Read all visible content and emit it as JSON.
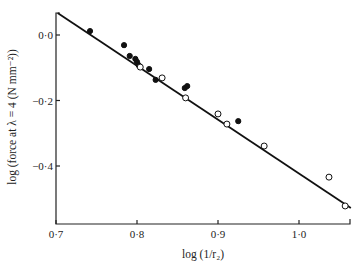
{
  "chart_data": {
    "type": "scatter",
    "title": "",
    "xlabel": "log (1/r₂)",
    "ylabel": "log (force at λ = 4 (N mm⁻²))",
    "xlim": [
      0.7,
      1.06
    ],
    "ylim": [
      -0.58,
      0.07
    ],
    "grid": false,
    "legend": null,
    "x_ticks": [
      {
        "value": 0.7,
        "label": "0·7"
      },
      {
        "value": 0.8,
        "label": "0·8"
      },
      {
        "value": 0.9,
        "label": "0·9"
      },
      {
        "value": 1.0,
        "label": "1·0"
      }
    ],
    "y_ticks": [
      {
        "value": 0.0,
        "label": "0·0"
      },
      {
        "value": -0.2,
        "label": "−0·2"
      },
      {
        "value": -0.4,
        "label": "−0·4"
      }
    ],
    "series": [
      {
        "name": "filled circles",
        "marker": "filled-circle",
        "points": [
          {
            "x": 0.742,
            "y": 0.012
          },
          {
            "x": 0.784,
            "y": -0.031
          },
          {
            "x": 0.791,
            "y": -0.064
          },
          {
            "x": 0.798,
            "y": -0.073
          },
          {
            "x": 0.8,
            "y": -0.082
          },
          {
            "x": 0.802,
            "y": -0.092
          },
          {
            "x": 0.815,
            "y": -0.104
          },
          {
            "x": 0.823,
            "y": -0.137
          },
          {
            "x": 0.859,
            "y": -0.162
          },
          {
            "x": 0.862,
            "y": -0.156
          },
          {
            "x": 0.925,
            "y": -0.263
          }
        ]
      },
      {
        "name": "open circles",
        "marker": "open-circle",
        "points": [
          {
            "x": 0.804,
            "y": -0.098
          },
          {
            "x": 0.831,
            "y": -0.131
          },
          {
            "x": 0.86,
            "y": -0.192
          },
          {
            "x": 0.9,
            "y": -0.241
          },
          {
            "x": 0.911,
            "y": -0.272
          },
          {
            "x": 0.957,
            "y": -0.339
          },
          {
            "x": 1.037,
            "y": -0.434
          },
          {
            "x": 1.057,
            "y": -0.522
          }
        ]
      }
    ],
    "fit_line": {
      "x1": 0.702,
      "y1": 0.067,
      "x2": 1.064,
      "y2": -0.528
    }
  }
}
